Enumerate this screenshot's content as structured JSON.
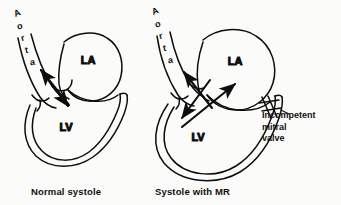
{
  "figure": {
    "background_color": "#fbfbf9",
    "ink_color": "#0d0d0d"
  },
  "panels": [
    {
      "id": "normal-systole",
      "caption": "Normal systole",
      "vessel_label": "Aorta",
      "vessel_letters": [
        "A",
        "o",
        "r",
        "t",
        "a"
      ],
      "chambers": [
        {
          "id": "left-atrium",
          "label": "LA"
        },
        {
          "id": "left-ventricle",
          "label": "LV"
        }
      ],
      "flow_arrows": [
        {
          "id": "aortic-outflow-arrow",
          "direction": "up-left",
          "meaning": "ejection into aorta"
        },
        {
          "id": "ventricular-arrow",
          "direction": "down-right",
          "meaning": "ventricular contraction"
        }
      ],
      "annotations": []
    },
    {
      "id": "systole-with-mr",
      "caption": "Systole with MR",
      "vessel_label": "Aorta",
      "vessel_letters": [
        "A",
        "o",
        "r",
        "t",
        "a"
      ],
      "chambers": [
        {
          "id": "left-atrium",
          "label": "LA"
        },
        {
          "id": "left-ventricle",
          "label": "LV"
        }
      ],
      "flow_arrows": [
        {
          "id": "aortic-outflow-arrow",
          "direction": "up-left",
          "meaning": "ejection into aorta"
        },
        {
          "id": "ventricular-arrow",
          "direction": "down-left",
          "meaning": "ventricular contraction"
        },
        {
          "id": "regurgitant-jet-arrow",
          "direction": "up-right",
          "meaning": "regurgitant flow into left atrium"
        }
      ],
      "annotations": [
        {
          "id": "incompetent-mitral-valve",
          "lines": [
            "Incompetent",
            "mitral",
            "valve"
          ],
          "marker": "valve-hatch-marker"
        }
      ]
    }
  ]
}
